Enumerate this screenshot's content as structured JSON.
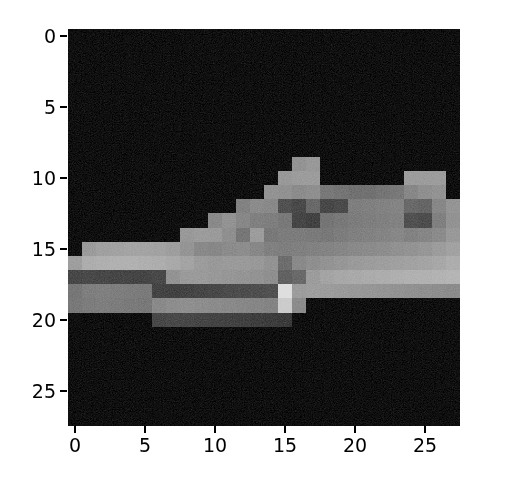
{
  "figure": {
    "background_color": "#ffffff",
    "plot_background_color": "#0a0a0a",
    "width": 512,
    "height": 493
  },
  "chart_data": {
    "type": "heatmap",
    "title": "",
    "subtitle": "",
    "xlabel": "",
    "ylabel": "",
    "colormap": "gray",
    "grid": false,
    "legend": null,
    "colorbar": false,
    "vmin": 0,
    "vmax": 255,
    "xlim": [
      -0.5,
      27.5
    ],
    "ylim": [
      27.5,
      -0.5
    ],
    "origin": "upper",
    "x_ticks": [
      0,
      5,
      10,
      15,
      20,
      25
    ],
    "y_ticks": [
      0,
      5,
      10,
      15,
      20,
      25
    ],
    "x_tick_labels": [
      "0",
      "5",
      "10",
      "15",
      "20",
      "25"
    ],
    "y_tick_labels": [
      "0",
      "5",
      "10",
      "15",
      "20",
      "25"
    ],
    "shape": [
      28,
      28
    ],
    "values": [
      [
        0,
        0,
        0,
        0,
        0,
        0,
        0,
        0,
        0,
        0,
        0,
        0,
        0,
        0,
        0,
        0,
        0,
        0,
        0,
        0,
        0,
        0,
        0,
        0,
        0,
        0,
        0,
        0
      ],
      [
        0,
        0,
        0,
        0,
        0,
        0,
        0,
        0,
        0,
        0,
        0,
        0,
        0,
        0,
        0,
        0,
        0,
        0,
        0,
        0,
        0,
        0,
        0,
        0,
        0,
        0,
        0,
        0
      ],
      [
        0,
        0,
        0,
        0,
        0,
        0,
        0,
        0,
        0,
        0,
        0,
        0,
        0,
        0,
        0,
        0,
        0,
        0,
        0,
        0,
        0,
        0,
        0,
        0,
        0,
        0,
        0,
        0
      ],
      [
        0,
        0,
        0,
        0,
        0,
        0,
        0,
        0,
        0,
        0,
        0,
        0,
        0,
        0,
        0,
        0,
        0,
        0,
        0,
        0,
        0,
        0,
        0,
        0,
        0,
        0,
        0,
        0
      ],
      [
        0,
        0,
        0,
        0,
        0,
        0,
        0,
        0,
        0,
        0,
        0,
        0,
        0,
        0,
        0,
        0,
        0,
        0,
        0,
        0,
        0,
        0,
        0,
        0,
        0,
        0,
        0,
        0
      ],
      [
        0,
        0,
        0,
        0,
        0,
        0,
        0,
        0,
        0,
        0,
        0,
        0,
        0,
        0,
        0,
        0,
        0,
        0,
        0,
        0,
        0,
        0,
        0,
        0,
        0,
        0,
        0,
        0
      ],
      [
        0,
        0,
        0,
        0,
        0,
        0,
        0,
        0,
        0,
        0,
        0,
        0,
        0,
        0,
        0,
        0,
        0,
        0,
        0,
        0,
        0,
        0,
        0,
        0,
        0,
        0,
        0,
        0
      ],
      [
        0,
        0,
        0,
        0,
        0,
        0,
        0,
        0,
        0,
        0,
        0,
        0,
        0,
        0,
        0,
        0,
        0,
        0,
        0,
        0,
        0,
        0,
        0,
        0,
        0,
        0,
        0,
        0
      ],
      [
        0,
        0,
        0,
        0,
        0,
        0,
        0,
        0,
        0,
        0,
        0,
        0,
        0,
        0,
        0,
        0,
        0,
        0,
        0,
        0,
        0,
        0,
        0,
        0,
        0,
        0,
        0,
        0
      ],
      [
        0,
        0,
        0,
        0,
        0,
        0,
        0,
        0,
        0,
        0,
        0,
        0,
        0,
        0,
        0,
        0,
        140,
        146,
        0,
        0,
        0,
        0,
        0,
        0,
        0,
        0,
        0,
        0
      ],
      [
        0,
        0,
        0,
        0,
        0,
        0,
        0,
        0,
        0,
        0,
        0,
        0,
        0,
        0,
        0,
        146,
        150,
        150,
        0,
        0,
        0,
        0,
        0,
        0,
        150,
        150,
        150,
        0
      ],
      [
        0,
        0,
        0,
        0,
        0,
        0,
        0,
        0,
        0,
        0,
        0,
        0,
        0,
        0,
        140,
        138,
        132,
        136,
        112,
        108,
        104,
        104,
        108,
        112,
        128,
        136,
        140,
        0
      ],
      [
        0,
        0,
        0,
        0,
        0,
        0,
        0,
        0,
        0,
        0,
        0,
        0,
        122,
        132,
        130,
        70,
        62,
        96,
        60,
        64,
        118,
        120,
        122,
        124,
        96,
        92,
        128,
        142
      ],
      [
        0,
        0,
        0,
        0,
        0,
        0,
        0,
        0,
        0,
        0,
        130,
        140,
        128,
        120,
        118,
        112,
        58,
        54,
        108,
        112,
        116,
        118,
        120,
        122,
        70,
        66,
        120,
        140
      ],
      [
        0,
        0,
        0,
        0,
        0,
        0,
        0,
        0,
        146,
        150,
        148,
        136,
        110,
        150,
        112,
        116,
        116,
        114,
        112,
        116,
        120,
        122,
        124,
        128,
        122,
        126,
        132,
        146
      ],
      [
        0,
        148,
        154,
        156,
        158,
        158,
        156,
        152,
        142,
        130,
        128,
        132,
        134,
        128,
        120,
        118,
        120,
        122,
        124,
        126,
        130,
        132,
        134,
        138,
        140,
        144,
        150,
        156
      ],
      [
        152,
        168,
        170,
        172,
        172,
        170,
        168,
        164,
        158,
        150,
        146,
        148,
        148,
        146,
        140,
        100,
        130,
        136,
        140,
        144,
        148,
        150,
        152,
        154,
        156,
        158,
        162,
        168
      ],
      [
        60,
        62,
        60,
        58,
        58,
        58,
        62,
        140,
        148,
        148,
        146,
        144,
        142,
        140,
        136,
        88,
        96,
        150,
        158,
        162,
        164,
        166,
        168,
        170,
        172,
        172,
        174,
        176
      ],
      [
        110,
        118,
        120,
        118,
        116,
        114,
        56,
        54,
        56,
        58,
        60,
        64,
        66,
        68,
        70,
        220,
        150,
        152,
        150,
        148,
        146,
        144,
        142,
        140,
        138,
        136,
        134,
        132
      ],
      [
        112,
        116,
        118,
        116,
        114,
        112,
        130,
        134,
        136,
        134,
        132,
        130,
        128,
        126,
        124,
        200,
        132,
        0,
        0,
        0,
        0,
        0,
        0,
        0,
        0,
        0,
        0,
        0
      ],
      [
        0,
        0,
        0,
        0,
        0,
        0,
        60,
        62,
        60,
        58,
        56,
        54,
        52,
        50,
        48,
        46,
        0,
        0,
        0,
        0,
        0,
        0,
        0,
        0,
        0,
        0,
        0,
        0
      ],
      [
        0,
        0,
        0,
        0,
        0,
        0,
        0,
        0,
        0,
        0,
        0,
        0,
        0,
        0,
        0,
        0,
        0,
        0,
        0,
        0,
        0,
        0,
        0,
        0,
        0,
        0,
        0,
        0
      ],
      [
        0,
        0,
        0,
        0,
        0,
        0,
        0,
        0,
        0,
        0,
        0,
        0,
        0,
        0,
        0,
        0,
        0,
        0,
        0,
        0,
        0,
        0,
        0,
        0,
        0,
        0,
        0,
        0
      ],
      [
        0,
        0,
        0,
        0,
        0,
        0,
        0,
        0,
        0,
        0,
        0,
        0,
        0,
        0,
        0,
        0,
        0,
        0,
        0,
        0,
        0,
        0,
        0,
        0,
        0,
        0,
        0,
        0
      ],
      [
        0,
        0,
        0,
        0,
        0,
        0,
        0,
        0,
        0,
        0,
        0,
        0,
        0,
        0,
        0,
        0,
        0,
        0,
        0,
        0,
        0,
        0,
        0,
        0,
        0,
        0,
        0,
        0
      ],
      [
        0,
        0,
        0,
        0,
        0,
        0,
        0,
        0,
        0,
        0,
        0,
        0,
        0,
        0,
        0,
        0,
        0,
        0,
        0,
        0,
        0,
        0,
        0,
        0,
        0,
        0,
        0,
        0
      ],
      [
        0,
        0,
        0,
        0,
        0,
        0,
        0,
        0,
        0,
        0,
        0,
        0,
        0,
        0,
        0,
        0,
        0,
        0,
        0,
        0,
        0,
        0,
        0,
        0,
        0,
        0,
        0,
        0
      ],
      [
        0,
        0,
        0,
        0,
        0,
        0,
        0,
        0,
        0,
        0,
        0,
        0,
        0,
        0,
        0,
        0,
        0,
        0,
        0,
        0,
        0,
        0,
        0,
        0,
        0,
        0,
        0,
        0
      ]
    ]
  }
}
